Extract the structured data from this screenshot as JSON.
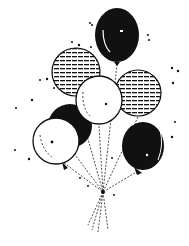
{
  "image": {
    "subject": "balloon bouquet clipart",
    "style": "black and white line art",
    "colors": {
      "ink": "#111111",
      "paper": "#ffffff"
    },
    "balloons": [
      {
        "id": "top-black",
        "fill": "solid",
        "cx": 117,
        "cy": 35,
        "rx": 22,
        "ry": 27
      },
      {
        "id": "left-striped",
        "fill": "striped",
        "cx": 76,
        "cy": 72,
        "rx": 24,
        "ry": 24
      },
      {
        "id": "right-striped",
        "fill": "striped",
        "cx": 138,
        "cy": 93,
        "rx": 23,
        "ry": 23
      },
      {
        "id": "center-white",
        "fill": "outline",
        "cx": 99,
        "cy": 100,
        "rx": 23,
        "ry": 24
      },
      {
        "id": "left-black",
        "fill": "solid",
        "cx": 70,
        "cy": 126,
        "rx": 22,
        "ry": 22
      },
      {
        "id": "left-white",
        "fill": "outline",
        "cx": 56,
        "cy": 141,
        "rx": 23,
        "ry": 23
      },
      {
        "id": "right-black",
        "fill": "solid",
        "cx": 143,
        "cy": 146,
        "rx": 21,
        "ry": 24
      }
    ],
    "knot": {
      "x": 103,
      "y": 192
    }
  }
}
